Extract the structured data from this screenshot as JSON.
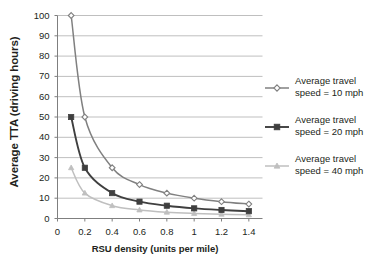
{
  "chart_data": {
    "type": "line",
    "title": "",
    "xlabel": "RSU  density (units per mile)",
    "ylabel": "Average TTA (driving hours)",
    "xlim": [
      0,
      1.5
    ],
    "ylim": [
      0,
      100
    ],
    "grid": true,
    "legend_position": "right",
    "xticks": [
      "0",
      "0.2",
      "0.4",
      "0.6",
      "0.8",
      "1",
      "1.2",
      "1.4"
    ],
    "xtick_values": [
      0,
      0.2,
      0.4,
      0.6,
      0.8,
      1.0,
      1.2,
      1.4
    ],
    "yticks": [
      "0",
      "10",
      "20",
      "30",
      "40",
      "50",
      "60",
      "70",
      "80",
      "90",
      "100"
    ],
    "ytick_values": [
      0,
      10,
      20,
      30,
      40,
      50,
      60,
      70,
      80,
      90,
      100
    ],
    "x": [
      0.1,
      0.2,
      0.4,
      0.6,
      0.8,
      1.0,
      1.2,
      1.4
    ],
    "series": [
      {
        "name": "Average travel speed = 10 mph",
        "label_line1": "Average travel",
        "label_line2": "speed = 10 mph",
        "marker": "diamond",
        "color": "#808080",
        "values": [
          100,
          50,
          25,
          16.7,
          12.5,
          10,
          8.3,
          7.1
        ]
      },
      {
        "name": "Average travel speed = 20 mph",
        "label_line1": "Average travel",
        "label_line2": "speed = 20 mph",
        "marker": "square",
        "color": "#3f3f3f",
        "values": [
          50,
          25,
          12.5,
          8.3,
          6.3,
          5,
          4.2,
          3.6
        ]
      },
      {
        "name": "Average travel speed = 40 mph",
        "label_line1": "Average travel",
        "label_line2": "speed = 40 mph",
        "marker": "triangle",
        "color": "#bfbfbf",
        "values": [
          25,
          12.5,
          6.3,
          4.2,
          3.1,
          2.5,
          2.1,
          1.8
        ]
      }
    ]
  },
  "colors": {
    "axis": "#7f7f7f",
    "grid": "#bfbfbf",
    "text": "#231f20",
    "series_10mph": "#808080",
    "series_20mph": "#3f3f3f",
    "series_40mph": "#bfbfbf"
  }
}
